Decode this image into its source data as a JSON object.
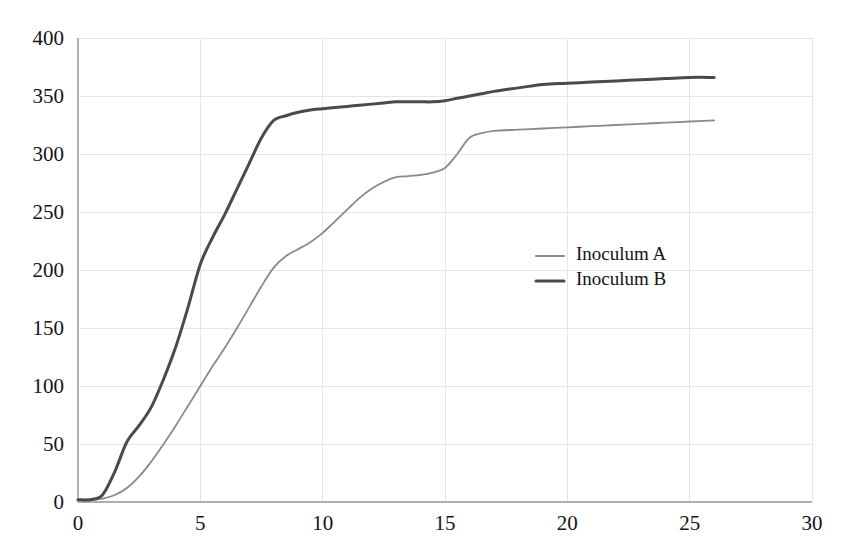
{
  "chart_data": {
    "type": "line",
    "title": "",
    "subtitle": "",
    "xlabel": "",
    "ylabel": "",
    "xlim": [
      0,
      30
    ],
    "ylim": [
      0,
      400
    ],
    "grid": true,
    "legend_position": "center-right",
    "xticks": [
      "0",
      "5",
      "10",
      "15",
      "20",
      "25",
      "30"
    ],
    "xtick_values": [
      0,
      5,
      10,
      15,
      20,
      25,
      30
    ],
    "yticks": [
      "0",
      "50",
      "100",
      "150",
      "200",
      "250",
      "300",
      "350",
      "400"
    ],
    "ytick_values": [
      0,
      50,
      100,
      150,
      200,
      250,
      300,
      350,
      400
    ],
    "x": [
      0,
      0.5,
      1,
      1.5,
      2,
      2.5,
      3,
      3.5,
      4,
      4.5,
      5,
      5.5,
      6,
      6.5,
      7,
      7.5,
      8,
      8.5,
      9,
      9.5,
      10,
      10.5,
      11,
      11.5,
      12,
      12.5,
      13,
      13.5,
      14,
      14.5,
      15,
      15.5,
      16,
      16.5,
      17,
      18,
      19,
      20,
      21,
      22,
      23,
      24,
      25,
      26
    ],
    "series": [
      {
        "name": "Inoculum A",
        "color": "#8a8a8a",
        "width": 1.8,
        "values": [
          2,
          2,
          3,
          6,
          12,
          22,
          35,
          50,
          66,
          83,
          100,
          117,
          133,
          150,
          168,
          186,
          202,
          212,
          218,
          224,
          232,
          242,
          252,
          262,
          270,
          276,
          280,
          281,
          282,
          284,
          288,
          300,
          314,
          318,
          320,
          321,
          322,
          323,
          324,
          325,
          326,
          327,
          328,
          329
        ]
      },
      {
        "name": "Inoculum B",
        "color": "#4a4a4a",
        "width": 3.0,
        "values": [
          2,
          2,
          6,
          26,
          52,
          66,
          82,
          106,
          134,
          168,
          205,
          228,
          248,
          270,
          292,
          314,
          329,
          333,
          336,
          338,
          339,
          340,
          341,
          342,
          343,
          344,
          345,
          345,
          345,
          345,
          346,
          348,
          350,
          352,
          354,
          357,
          360,
          361,
          362,
          363,
          364,
          365,
          366,
          366
        ]
      }
    ]
  },
  "legend": {
    "entries": [
      {
        "label": "Inoculum A",
        "swatch_color": "#8a8a8a",
        "swatch_width": 1.8
      },
      {
        "label": "Inoculum B",
        "swatch_color": "#4a4a4a",
        "swatch_width": 3.0
      }
    ]
  },
  "style": {
    "background": "#ffffff",
    "grid_color": "#e6e6e6",
    "axis_color": "#b0b0b0",
    "text_color": "#141414"
  }
}
